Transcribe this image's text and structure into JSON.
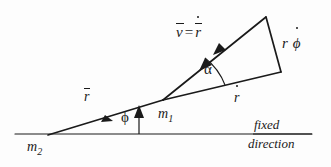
{
  "figure": {
    "background_color": "#fdfdfd",
    "ink_color": "#1a1a1a",
    "width": 331,
    "height": 167,
    "labels": {
      "velocity_vector": {
        "v_symbol": "v",
        "equals": "=",
        "r_symbol": "r",
        "text": "v̄ = r̄̇"
      },
      "transverse_component": {
        "r_symbol": "r",
        "phi_symbol": "ϕ",
        "text": "r ϕ̇"
      },
      "angle_alpha": "α",
      "radial_component": {
        "r_symbol": "r",
        "text": "ṙ"
      },
      "position_vector": {
        "r_symbol": "r",
        "text": "r̄"
      },
      "angle_phi": "ϕ",
      "mass_one": {
        "symbol": "m",
        "subscript": "1",
        "text": "m₁"
      },
      "mass_two": {
        "symbol": "m",
        "subscript": "2",
        "text": "m₂"
      },
      "reference_line_1": "fixed",
      "reference_line_2": "direction"
    }
  },
  "geometry": {
    "fixed_direction_line": {
      "x1": 15,
      "y1": 134,
      "x2": 312,
      "y2": 134
    },
    "mass_two_vertex": {
      "x": 48,
      "y": 135
    },
    "mass_one_vertex": {
      "x": 163,
      "y": 100
    },
    "triangle_apex": {
      "x": 266,
      "y": 17
    },
    "triangle_right_corner": {
      "x": 281,
      "y": 72
    },
    "phi_marker_arrow": {
      "x": 139,
      "y_bottom": 134,
      "y_top": 107
    }
  }
}
